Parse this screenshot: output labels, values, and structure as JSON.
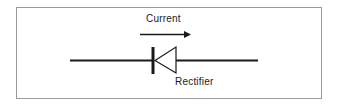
{
  "diagram": {
    "current_label": "Current",
    "component_label": "Rectifier",
    "symbol": "diode-icon",
    "arrow": "arrow-right-icon",
    "colors": {
      "stroke": "#1a1a1a",
      "border": "#9a9a9a",
      "background": "#ffffff"
    }
  }
}
